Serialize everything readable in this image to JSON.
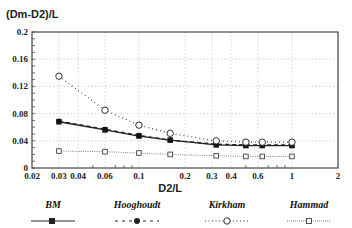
{
  "chart_data": {
    "type": "line",
    "title": "",
    "ylabel": "(Dm-D2)/L",
    "xlabel": "D2/L",
    "xscale": "log",
    "xlim": [
      0.02,
      2
    ],
    "ylim": [
      0,
      0.2
    ],
    "x_ticks": [
      "0.02",
      "0.03",
      "0.04",
      "0.06",
      "0.1",
      "0.2",
      "0.3",
      "0.4",
      "0.6",
      "1",
      "2"
    ],
    "x_tick_values": [
      0.02,
      0.03,
      0.04,
      0.06,
      0.1,
      0.2,
      0.3,
      0.4,
      0.6,
      1,
      2
    ],
    "y_ticks": [
      "0",
      "0.04",
      "0.08",
      "0.12",
      "0.16",
      "0.2"
    ],
    "y_tick_values": [
      0,
      0.04,
      0.08,
      0.12,
      0.16,
      0.2
    ],
    "grid": true,
    "legend_position": "bottom",
    "x": [
      0.03,
      0.06,
      0.1,
      0.16,
      0.32,
      0.5,
      0.64,
      1
    ],
    "series": [
      {
        "name": "BM",
        "values": [
          0.068,
          0.056,
          0.047,
          0.041,
          0.034,
          0.033,
          0.033,
          0.033
        ],
        "marker": "filled-square",
        "line": "solid"
      },
      {
        "name": "Hooghoudt",
        "values": [
          0.069,
          0.057,
          0.048,
          0.041,
          0.035,
          0.034,
          0.034,
          0.034
        ],
        "marker": "filled-circle",
        "line": "dashed"
      },
      {
        "name": "Kirkham",
        "values": [
          0.135,
          0.085,
          0.063,
          0.051,
          0.04,
          0.038,
          0.038,
          0.038
        ],
        "marker": "open-circle",
        "line": "dotted"
      },
      {
        "name": "Hammad",
        "values": [
          0.025,
          0.024,
          0.022,
          0.02,
          0.018,
          0.017,
          0.017,
          0.017
        ],
        "marker": "open-square",
        "line": "dotted-fine"
      }
    ]
  },
  "legend": {
    "items": [
      {
        "label": "BM"
      },
      {
        "label": "Hooghoudt"
      },
      {
        "label": "Kirkham"
      },
      {
        "label": "Hammad"
      }
    ]
  }
}
